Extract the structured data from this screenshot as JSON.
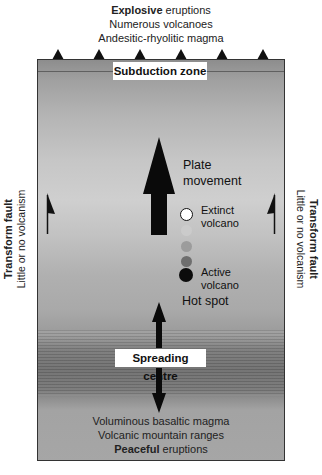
{
  "diagram": {
    "top_caption": {
      "line1_bold": "Explosive",
      "line1_rest": " eruptions",
      "line2": "Numerous volcanoes",
      "line3": "Andesitic-rhyolitic magma"
    },
    "subduction_label": "Subduction zone",
    "spreading_label": "Spreading centre",
    "plate_movement": {
      "line1": "Plate",
      "line2": "movement"
    },
    "legend": {
      "extinct_line1": "Extinct",
      "extinct_line2": "volcano",
      "active_line1": "Active",
      "active_line2": "volcano",
      "circle_colors": [
        "#ffffff",
        "#c8c8c8",
        "#9e9e9e",
        "#6e6e6e",
        "#111111"
      ]
    },
    "hot_spot_label": "Hot spot",
    "left_side": {
      "title": "Transform fault",
      "subtitle": "Little or no volcanism"
    },
    "right_side": {
      "title": "Transform fault",
      "subtitle": "Little or no volcanism"
    },
    "bottom_caption": {
      "line1": "Voluminous basaltic magma",
      "line2": "Volcanic mountain ranges",
      "line3_bold": "Peaceful",
      "line3_rest": " eruptions"
    },
    "volcano_markers_count": 6
  }
}
